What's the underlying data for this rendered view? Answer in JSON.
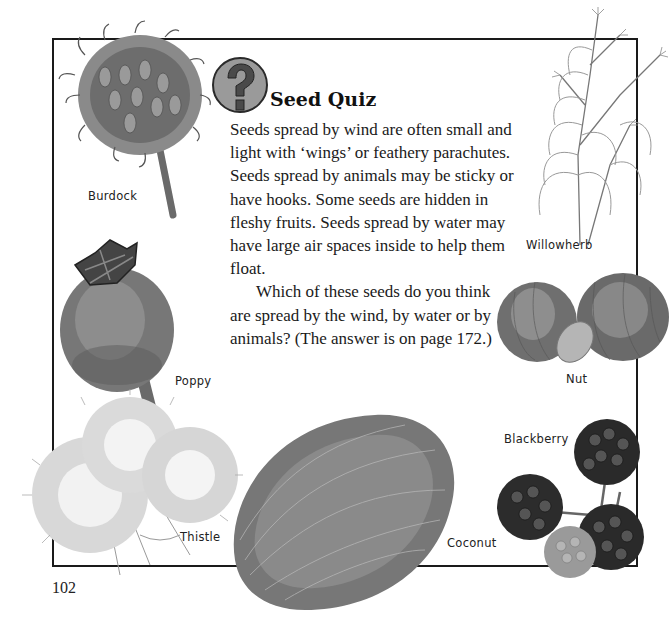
{
  "page": {
    "title": "Seed Quiz",
    "title_icon": "question-mark-icon",
    "paragraphs": [
      "Seeds spread by wind are often small and light with ‘wings’ or feathery parachutes. Seeds spread by animals may be sticky or have hooks. Some seeds are hidden in fleshy fruits. Seeds spread by water may have large air spaces inside to help them float.",
      "Which of these seeds do you think are spread by the wind, by water or by animals? (The answer is on page 172.)"
    ],
    "page_number": "102"
  },
  "illustrations": {
    "burdock": {
      "label": "Burdock"
    },
    "poppy": {
      "label": "Poppy"
    },
    "thistle": {
      "label": "Thistle"
    },
    "coconut": {
      "label": "Coconut"
    },
    "willowherb": {
      "label": "Willowherb"
    },
    "nut": {
      "label": "Nut"
    },
    "blackberry": {
      "label": "Blackberry"
    }
  },
  "colors": {
    "frame": "#1a1a1a",
    "icon_fill": "#9a9a9a",
    "icon_glyph": "#4a4a4a"
  }
}
